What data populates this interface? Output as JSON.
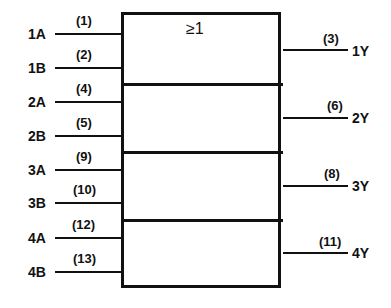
{
  "gate": {
    "symbol": "≥1"
  },
  "inputs": [
    {
      "name": "1A",
      "pin": "(1)"
    },
    {
      "name": "1B",
      "pin": "(2)"
    },
    {
      "name": "2A",
      "pin": "(4)"
    },
    {
      "name": "2B",
      "pin": "(5)"
    },
    {
      "name": "3A",
      "pin": "(9)"
    },
    {
      "name": "3B",
      "pin": "(10)"
    },
    {
      "name": "4A",
      "pin": "(12)"
    },
    {
      "name": "4B",
      "pin": "(13)"
    }
  ],
  "outputs": [
    {
      "name": "1Y",
      "pin": "(3)"
    },
    {
      "name": "2Y",
      "pin": "(6)"
    },
    {
      "name": "3Y",
      "pin": "(8)"
    },
    {
      "name": "4Y",
      "pin": "(11)"
    }
  ]
}
